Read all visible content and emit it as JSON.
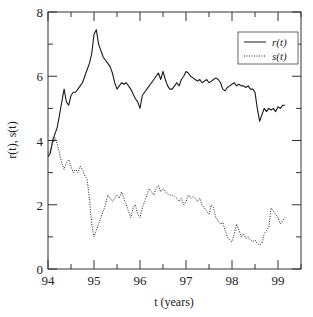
{
  "chart_data": {
    "type": "line",
    "title": "",
    "xlabel": "t (years)",
    "ylabel": "r(t), s(t)",
    "xlim": [
      94,
      99.5
    ],
    "ylim": [
      0,
      8
    ],
    "x_ticks": [
      94,
      95,
      96,
      97,
      98,
      99
    ],
    "x_tick_labels": [
      "94",
      "95",
      "96",
      "97",
      "98",
      "99"
    ],
    "y_ticks": [
      0,
      2,
      4,
      6,
      8
    ],
    "y_tick_labels": [
      "0",
      "2",
      "4",
      "6",
      "8"
    ],
    "grid": false,
    "legend_position": "upper right",
    "series": [
      {
        "name": "r(t)",
        "style": "solid",
        "x": [
          94.0,
          94.05,
          94.1,
          94.15,
          94.2,
          94.25,
          94.3,
          94.35,
          94.4,
          94.45,
          94.5,
          94.55,
          94.6,
          94.65,
          94.7,
          94.75,
          94.8,
          94.85,
          94.9,
          94.95,
          95.0,
          95.05,
          95.1,
          95.15,
          95.2,
          95.25,
          95.3,
          95.35,
          95.4,
          95.45,
          95.5,
          95.55,
          95.6,
          95.65,
          95.7,
          95.75,
          95.8,
          95.85,
          95.9,
          95.95,
          96.0,
          96.05,
          96.1,
          96.15,
          96.2,
          96.25,
          96.3,
          96.35,
          96.4,
          96.45,
          96.5,
          96.55,
          96.6,
          96.65,
          96.7,
          96.75,
          96.8,
          96.85,
          96.9,
          96.95,
          97.0,
          97.05,
          97.1,
          97.15,
          97.2,
          97.25,
          97.3,
          97.35,
          97.4,
          97.45,
          97.5,
          97.55,
          97.6,
          97.65,
          97.7,
          97.75,
          97.8,
          97.85,
          97.9,
          97.95,
          98.0,
          98.05,
          98.1,
          98.15,
          98.2,
          98.25,
          98.3,
          98.35,
          98.4,
          98.45,
          98.5,
          98.55,
          98.6,
          98.65,
          98.7,
          98.75,
          98.8,
          98.85,
          98.9,
          98.95,
          99.0,
          99.05,
          99.1,
          99.15
        ],
        "values": [
          3.5,
          3.6,
          4.0,
          4.2,
          4.4,
          4.8,
          5.2,
          5.6,
          5.2,
          5.1,
          5.4,
          5.5,
          5.5,
          5.6,
          5.7,
          5.8,
          6.0,
          6.2,
          6.4,
          6.7,
          7.3,
          7.45,
          7.0,
          6.8,
          6.6,
          6.5,
          6.4,
          6.3,
          6.1,
          5.8,
          5.6,
          5.7,
          5.8,
          5.75,
          5.8,
          5.7,
          5.6,
          5.45,
          5.3,
          5.2,
          5.0,
          5.4,
          5.5,
          5.6,
          5.7,
          5.8,
          5.9,
          6.0,
          6.1,
          5.9,
          6.15,
          5.9,
          5.7,
          5.6,
          5.6,
          5.7,
          5.8,
          5.7,
          5.9,
          6.0,
          6.15,
          6.1,
          6.0,
          5.95,
          5.9,
          5.85,
          5.9,
          5.8,
          5.85,
          5.9,
          5.8,
          5.85,
          5.9,
          5.95,
          5.9,
          5.8,
          5.6,
          5.55,
          5.65,
          5.7,
          5.75,
          5.8,
          5.7,
          5.75,
          5.7,
          5.7,
          5.65,
          5.7,
          5.6,
          5.6,
          5.5,
          5.0,
          4.6,
          4.8,
          5.0,
          4.9,
          5.0,
          4.95,
          5.0,
          4.9,
          5.05,
          5.0,
          5.1,
          5.1
        ]
      },
      {
        "name": "s(t)",
        "style": "dotted",
        "x": [
          94.0,
          94.05,
          94.1,
          94.15,
          94.2,
          94.25,
          94.3,
          94.35,
          94.4,
          94.45,
          94.5,
          94.55,
          94.6,
          94.65,
          94.7,
          94.75,
          94.8,
          94.85,
          94.9,
          94.95,
          95.0,
          95.05,
          95.1,
          95.15,
          95.2,
          95.25,
          95.3,
          95.35,
          95.4,
          95.45,
          95.5,
          95.55,
          95.6,
          95.65,
          95.7,
          95.75,
          95.8,
          95.85,
          95.9,
          95.95,
          96.0,
          96.05,
          96.1,
          96.15,
          96.2,
          96.25,
          96.3,
          96.35,
          96.4,
          96.45,
          96.5,
          96.55,
          96.6,
          96.65,
          96.7,
          96.75,
          96.8,
          96.85,
          96.9,
          96.95,
          97.0,
          97.05,
          97.1,
          97.15,
          97.2,
          97.25,
          97.3,
          97.35,
          97.4,
          97.45,
          97.5,
          97.55,
          97.6,
          97.65,
          97.7,
          97.75,
          97.8,
          97.85,
          97.9,
          97.95,
          98.0,
          98.05,
          98.1,
          98.15,
          98.2,
          98.25,
          98.3,
          98.35,
          98.4,
          98.45,
          98.5,
          98.55,
          98.6,
          98.65,
          98.7,
          98.75,
          98.8,
          98.85,
          98.9,
          98.95,
          99.0,
          99.05,
          99.1,
          99.15
        ],
        "values": [
          3.6,
          3.7,
          3.9,
          4.1,
          3.9,
          3.6,
          3.3,
          3.1,
          3.3,
          3.4,
          3.2,
          3.0,
          3.1,
          3.0,
          3.2,
          3.1,
          2.9,
          2.8,
          2.2,
          1.4,
          1.0,
          1.2,
          1.4,
          1.6,
          1.8,
          2.0,
          2.3,
          2.2,
          2.1,
          2.2,
          2.3,
          2.2,
          2.4,
          2.2,
          2.0,
          1.8,
          1.6,
          1.9,
          2.0,
          1.7,
          1.6,
          1.9,
          2.1,
          2.3,
          2.5,
          2.4,
          2.3,
          2.5,
          2.6,
          2.4,
          2.5,
          2.4,
          2.35,
          2.3,
          2.3,
          2.25,
          2.2,
          2.1,
          2.2,
          2.0,
          2.1,
          2.3,
          2.2,
          2.25,
          2.2,
          2.1,
          2.2,
          2.0,
          1.9,
          1.8,
          1.7,
          2.0,
          1.9,
          1.6,
          1.5,
          1.4,
          1.45,
          1.2,
          1.0,
          0.9,
          0.85,
          1.1,
          1.4,
          1.2,
          1.0,
          1.1,
          0.95,
          1.0,
          0.9,
          0.85,
          0.9,
          0.8,
          0.75,
          0.8,
          1.1,
          1.2,
          1.3,
          1.9,
          1.8,
          1.7,
          1.6,
          1.4,
          1.5,
          1.6
        ]
      }
    ]
  },
  "legend": {
    "items": [
      {
        "label": "r(t)",
        "style": "solid"
      },
      {
        "label": "s(t)",
        "style": "dotted"
      }
    ]
  },
  "axes": {
    "xlabel": "t (years)",
    "ylabel": "r(t), s(t)"
  },
  "colors": {
    "line": "#1a1a1a",
    "axis": "#333333",
    "background": "#ffffff"
  }
}
